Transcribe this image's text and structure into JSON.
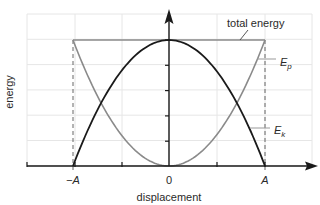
{
  "chart_data": {
    "type": "line",
    "title": "",
    "xlabel": "displacement",
    "ylabel": "energy",
    "x_tick_labels": [
      "−A",
      "0",
      "A"
    ],
    "x_tick_values": [
      -1,
      0,
      1
    ],
    "xlim": [
      -2,
      2.9
    ],
    "ylim": [
      0,
      1.2
    ],
    "grid": true,
    "series": [
      {
        "name": "total energy",
        "label": "total energy",
        "color": "#8a8a8a",
        "x": [
          -1,
          -0.5,
          0,
          0.5,
          1
        ],
        "y": [
          1,
          1,
          1,
          1,
          1
        ]
      },
      {
        "name": "Ep",
        "label_main": "E",
        "label_sub": "p",
        "color": "#8a8a8a",
        "x": [
          -1,
          -0.75,
          -0.5,
          -0.25,
          0,
          0.25,
          0.5,
          0.75,
          1
        ],
        "y": [
          1,
          0.5625,
          0.25,
          0.0625,
          0,
          0.0625,
          0.25,
          0.5625,
          1
        ]
      },
      {
        "name": "Ek",
        "label_main": "E",
        "label_sub": "k",
        "color": "#1a1a1a",
        "x": [
          -1,
          -0.75,
          -0.5,
          -0.25,
          0,
          0.25,
          0.5,
          0.75,
          1
        ],
        "y": [
          0,
          0.4375,
          0.75,
          0.9375,
          1,
          0.9375,
          0.75,
          0.4375,
          0
        ]
      }
    ],
    "annotations": [
      {
        "text": "total energy",
        "target": "total energy line"
      },
      {
        "text": "Ep",
        "target": "potential energy curve"
      },
      {
        "text": "Ek",
        "target": "kinetic energy curve"
      }
    ],
    "dashed_verticals_at": [
      -1,
      1
    ]
  },
  "colors": {
    "grid": "#e6e6e6",
    "axis": "#1a1a1a",
    "dashed": "#555555"
  }
}
